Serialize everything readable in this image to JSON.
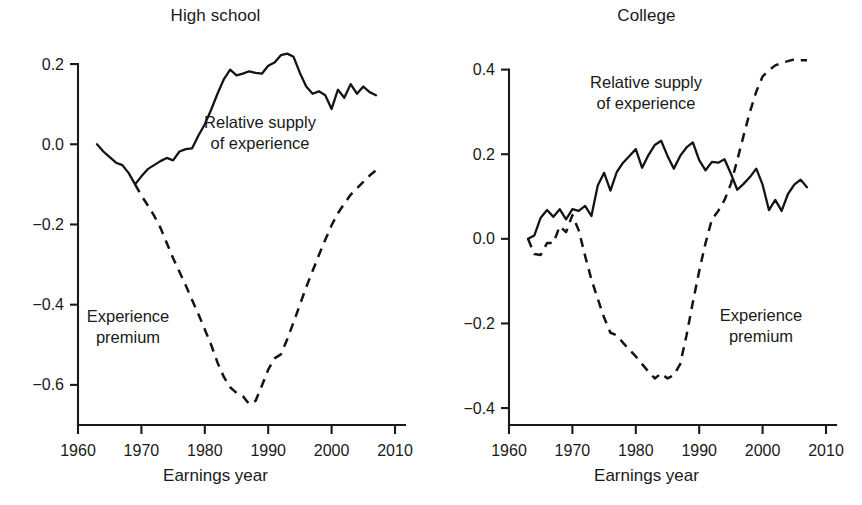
{
  "figure": {
    "background": "#ffffff",
    "ink_color": "#141414",
    "panel_count": 2
  },
  "chart_data": [
    {
      "type": "line",
      "title": "High school",
      "xlabel": "Earnings year",
      "ylabel": "",
      "xlim": [
        1960,
        2010
      ],
      "ylim": [
        -0.7,
        0.26
      ],
      "xticks": [
        1960,
        1970,
        1980,
        1990,
        2000,
        2010
      ],
      "xticklabels": [
        "1960",
        "1970",
        "1980",
        "1990",
        "2000",
        "2010"
      ],
      "yticks": [
        0.2,
        0.0,
        -0.2,
        -0.4,
        -0.6
      ],
      "yticklabels": [
        "0.2",
        "0.0",
        "-0.2",
        "-0.4",
        "-0.6"
      ],
      "grid": false,
      "legend": "inline-annotations",
      "annotations": [
        {
          "text": "Relative supply\nof experience",
          "x": 1986,
          "y": 0.055
        },
        {
          "text": "Experience\npremium",
          "x": 1971.5,
          "y": -0.44
        }
      ],
      "series": [
        {
          "name": "Relative supply of experience",
          "style": "solid",
          "x": [
            1963,
            1964,
            1965,
            1966,
            1967,
            1968,
            1969,
            1970,
            1971,
            1972,
            1973,
            1974,
            1975,
            1976,
            1977,
            1978,
            1979,
            1980,
            1981,
            1982,
            1983,
            1984,
            1985,
            1986,
            1987,
            1988,
            1989,
            1990,
            1991,
            1992,
            1993,
            1994,
            1995,
            1996,
            1997,
            1998,
            1999,
            2000,
            2001,
            2002,
            2003,
            2004,
            2005,
            2006,
            2007
          ],
          "values": [
            0.0,
            -0.018,
            -0.032,
            -0.046,
            -0.052,
            -0.072,
            -0.1,
            -0.08,
            -0.062,
            -0.052,
            -0.042,
            -0.034,
            -0.04,
            -0.018,
            -0.012,
            -0.01,
            0.022,
            0.05,
            0.086,
            0.126,
            0.162,
            0.186,
            0.172,
            0.176,
            0.182,
            0.178,
            0.176,
            0.196,
            0.204,
            0.222,
            0.226,
            0.218,
            0.178,
            0.144,
            0.126,
            0.132,
            0.122,
            0.088,
            0.136,
            0.116,
            0.15,
            0.126,
            0.144,
            0.13,
            0.122
          ]
        },
        {
          "name": "Experience premium",
          "style": "dashed",
          "x": [
            1969,
            1970,
            1971,
            1972,
            1973,
            1974,
            1975,
            1976,
            1977,
            1978,
            1979,
            1980,
            1981,
            1982,
            1983,
            1984,
            1985,
            1986,
            1987,
            1988,
            1989,
            1990,
            1991,
            1992,
            1993,
            1994,
            1995,
            1996,
            1997,
            1998,
            1999,
            2000,
            2001,
            2002,
            2003,
            2004,
            2005,
            2006,
            2007
          ],
          "values": [
            -0.1,
            -0.128,
            -0.152,
            -0.178,
            -0.208,
            -0.246,
            -0.284,
            -0.318,
            -0.352,
            -0.388,
            -0.424,
            -0.462,
            -0.5,
            -0.544,
            -0.58,
            -0.606,
            -0.62,
            -0.628,
            -0.648,
            -0.64,
            -0.602,
            -0.562,
            -0.534,
            -0.524,
            -0.486,
            -0.444,
            -0.4,
            -0.356,
            -0.316,
            -0.276,
            -0.238,
            -0.202,
            -0.172,
            -0.148,
            -0.126,
            -0.11,
            -0.094,
            -0.078,
            -0.065
          ]
        }
      ]
    },
    {
      "type": "line",
      "title": "College",
      "xlabel": "Earnings year",
      "ylabel": "",
      "xlim": [
        1960,
        2010
      ],
      "ylim": [
        -0.44,
        0.47
      ],
      "xticks": [
        1960,
        1970,
        1980,
        1990,
        2000,
        2010
      ],
      "xticklabels": [
        "1960",
        "1970",
        "1980",
        "1990",
        "2000",
        "2010"
      ],
      "yticks": [
        0.4,
        0.2,
        0.0,
        -0.2,
        -0.4
      ],
      "yticklabels": [
        "0.4",
        "0.2",
        "0.0",
        "-0.2",
        "-0.4"
      ],
      "grid": false,
      "legend": "inline-annotations",
      "annotations": [
        {
          "text": "Relative supply\nof experience",
          "x": 1982,
          "y": 0.325
        },
        {
          "text": "Experience\npremium",
          "x": 1998.5,
          "y": -0.225
        }
      ],
      "series": [
        {
          "name": "Relative supply of experience",
          "style": "solid",
          "x": [
            1963,
            1964,
            1965,
            1966,
            1967,
            1968,
            1969,
            1970,
            1971,
            1972,
            1973,
            1974,
            1975,
            1976,
            1977,
            1978,
            1979,
            1980,
            1981,
            1982,
            1983,
            1984,
            1985,
            1986,
            1987,
            1988,
            1989,
            1990,
            1991,
            1992,
            1993,
            1994,
            1995,
            1996,
            1997,
            1998,
            1999,
            2000,
            2001,
            2002,
            2003,
            2004,
            2005,
            2006,
            2007
          ],
          "values": [
            0.0,
            0.008,
            0.05,
            0.068,
            0.052,
            0.07,
            0.046,
            0.07,
            0.066,
            0.078,
            0.054,
            0.126,
            0.156,
            0.114,
            0.158,
            0.18,
            0.196,
            0.212,
            0.168,
            0.198,
            0.222,
            0.232,
            0.196,
            0.166,
            0.196,
            0.216,
            0.228,
            0.186,
            0.162,
            0.182,
            0.18,
            0.188,
            0.154,
            0.116,
            0.13,
            0.146,
            0.166,
            0.128,
            0.068,
            0.092,
            0.066,
            0.106,
            0.128,
            0.14,
            0.122
          ]
        },
        {
          "name": "Experience premium",
          "style": "dashed",
          "x": [
            1963,
            1964,
            1965,
            1966,
            1967,
            1968,
            1969,
            1970,
            1971,
            1972,
            1973,
            1974,
            1975,
            1976,
            1977,
            1978,
            1979,
            1980,
            1981,
            1982,
            1983,
            1984,
            1985,
            1986,
            1987,
            1988,
            1989,
            1990,
            1991,
            1992,
            1993,
            1994,
            1995,
            1996,
            1997,
            1998,
            1999,
            2000,
            2001,
            2002,
            2003,
            2004,
            2005,
            2006,
            2007
          ],
          "values": [
            0.0,
            -0.036,
            -0.038,
            -0.01,
            -0.01,
            0.03,
            0.016,
            0.056,
            0.02,
            -0.04,
            -0.096,
            -0.142,
            -0.186,
            -0.222,
            -0.228,
            -0.246,
            -0.262,
            -0.278,
            -0.296,
            -0.314,
            -0.33,
            -0.318,
            -0.33,
            -0.322,
            -0.296,
            -0.228,
            -0.15,
            -0.076,
            -0.01,
            0.046,
            0.066,
            0.092,
            0.13,
            0.186,
            0.244,
            0.3,
            0.348,
            0.384,
            0.398,
            0.41,
            0.416,
            0.42,
            0.424,
            0.422,
            0.422
          ]
        }
      ]
    }
  ],
  "panels": [
    {
      "id": "high-school",
      "title": "High school",
      "axis_title": "Earnings year",
      "ytick_labels": [
        "0.2",
        "0.0",
        "−0.2",
        "−0.4",
        "−0.6"
      ],
      "xtick_labels": [
        "1960",
        "1970",
        "1980",
        "1990",
        "2000",
        "2010"
      ],
      "annotation_supply": "Relative supply\nof experience",
      "annotation_premium": "Experience\npremium"
    },
    {
      "id": "college",
      "title": "College",
      "axis_title": "Earnings year",
      "ytick_labels": [
        "0.4",
        "0.2",
        "0.0",
        "−0.2",
        "−0.4"
      ],
      "xtick_labels": [
        "1960",
        "1970",
        "1980",
        "1990",
        "2000",
        "2010"
      ],
      "annotation_supply": "Relative supply\nof experience",
      "annotation_premium": "Experience\npremium"
    }
  ]
}
